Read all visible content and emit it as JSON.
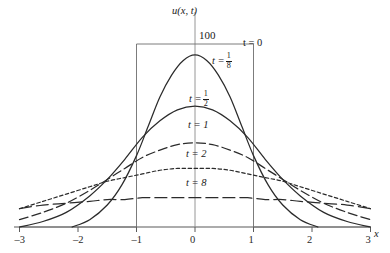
{
  "figure": {
    "y_axis_label": "u(x, t)",
    "x_axis_label": "x",
    "peak_value_label": "100"
  },
  "axes": {
    "x_ticks": [
      {
        "value": -3,
        "label": "–3"
      },
      {
        "value": -2,
        "label": "–2"
      },
      {
        "value": -1,
        "label": "–1"
      },
      {
        "value": 0,
        "label": "0"
      },
      {
        "value": 1,
        "label": "1"
      },
      {
        "value": 2,
        "label": "2"
      },
      {
        "value": 3,
        "label": "3"
      }
    ]
  },
  "curve_labels": {
    "t0": "t = 0",
    "t18_lead": "t =",
    "t18_num": "1",
    "t18_den": "8",
    "t12_lead": "t =",
    "t12_num": "1",
    "t12_den": "2",
    "t1": "t = 1",
    "t2": "t = 2",
    "t8": "t = 8"
  },
  "chart_data": {
    "type": "line",
    "title": "",
    "xlabel": "x",
    "ylabel": "u(x, t)",
    "xlim": [
      -3.2,
      3.35
    ],
    "ylim": [
      0,
      112
    ],
    "grid": false,
    "legend": "inline-curve-labels",
    "annotations": [
      "100"
    ],
    "series": [
      {
        "name": "t = 0",
        "style": "solid-thin-step",
        "description": "Initial condition: rectangular pulse u = 100 on -1 < x < 1, zero elsewhere",
        "x": [
          -3,
          -1,
          -1,
          1,
          1,
          3
        ],
        "values": [
          0,
          0,
          100,
          100,
          0,
          0
        ]
      },
      {
        "name": "t = 1/8",
        "style": "solid",
        "x": [
          -2.1,
          -1.8,
          -1.5,
          -1.25,
          -1.0,
          -0.8,
          -0.6,
          -0.4,
          -0.2,
          0,
          0.2,
          0.4,
          0.6,
          0.8,
          1.0,
          1.25,
          1.5,
          1.8,
          2.1
        ],
        "values": [
          0,
          4,
          12,
          23,
          39,
          55,
          71,
          83,
          91,
          94,
          91,
          83,
          71,
          55,
          39,
          23,
          12,
          4,
          0
        ]
      },
      {
        "name": "t = 1/2",
        "style": "solid",
        "x": [
          -3,
          -2.6,
          -2.2,
          -1.8,
          -1.5,
          -1.2,
          -0.9,
          -0.6,
          -0.3,
          0,
          0.3,
          0.6,
          0.9,
          1.2,
          1.5,
          1.8,
          2.2,
          2.6,
          3
        ],
        "values": [
          0,
          3,
          8,
          17,
          26,
          37,
          49,
          58,
          64,
          66,
          64,
          58,
          49,
          37,
          26,
          17,
          8,
          3,
          0
        ]
      },
      {
        "name": "t = 1",
        "style": "dashed-long",
        "x": [
          -3,
          -2.6,
          -2.2,
          -1.8,
          -1.5,
          -1.2,
          -0.9,
          -0.6,
          -0.3,
          0,
          0.3,
          0.6,
          0.9,
          1.2,
          1.5,
          1.8,
          2.2,
          2.6,
          3
        ],
        "values": [
          4,
          8,
          13,
          20,
          26,
          32,
          38,
          42,
          45,
          46,
          45,
          42,
          38,
          32,
          26,
          20,
          13,
          8,
          4
        ]
      },
      {
        "name": "t = 2",
        "style": "dashed-short",
        "x": [
          -3,
          -2.6,
          -2.2,
          -1.8,
          -1.5,
          -1.2,
          -0.9,
          -0.6,
          -0.3,
          0,
          0.3,
          0.6,
          0.9,
          1.2,
          1.5,
          1.8,
          2.2,
          2.6,
          3
        ],
        "values": [
          10,
          14,
          18,
          22,
          25,
          27,
          29,
          31,
          32,
          32,
          32,
          31,
          29,
          27,
          25,
          22,
          18,
          14,
          10
        ]
      },
      {
        "name": "t = 8",
        "style": "dashed-verylong",
        "x": [
          -3,
          -2.6,
          -2.2,
          -1.8,
          -1.5,
          -1.2,
          -0.9,
          -0.6,
          -0.3,
          0,
          0.3,
          0.6,
          0.9,
          1.2,
          1.5,
          1.8,
          2.2,
          2.6,
          3
        ],
        "values": [
          10,
          12,
          13,
          14,
          15,
          15,
          16,
          16,
          16,
          16,
          16,
          16,
          16,
          15,
          15,
          14,
          13,
          12,
          10
        ]
      }
    ]
  }
}
